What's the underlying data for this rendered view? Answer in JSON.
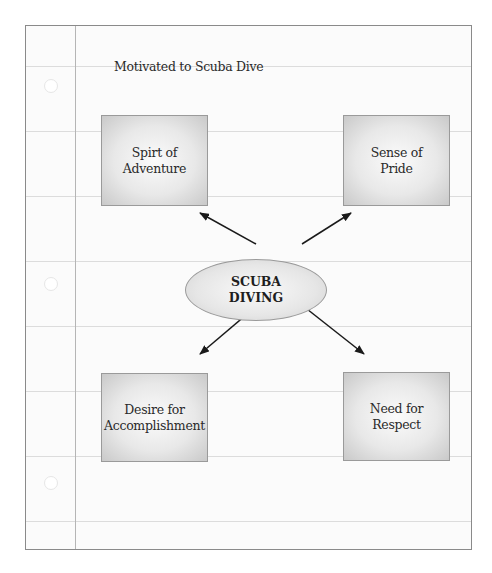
{
  "diagram": {
    "title": "Motivated to Scuba Dive",
    "center_node": {
      "label": "SCUBA\nDIVING"
    },
    "nodes": [
      {
        "position": "top-left",
        "label": "Spirt of\nAdventure"
      },
      {
        "position": "top-right",
        "label": "Sense of\nPride"
      },
      {
        "position": "bottom-left",
        "label": "Desire for\nAccomplishment"
      },
      {
        "position": "bottom-right",
        "label": "Need for\nRespect"
      }
    ],
    "edges": [
      {
        "from": "SCUBA DIVING",
        "to": "Spirt of Adventure",
        "arrow": "to"
      },
      {
        "from": "SCUBA DIVING",
        "to": "Sense of Pride",
        "arrow": "to"
      },
      {
        "from": "SCUBA DIVING",
        "to": "Desire for Accomplishment",
        "arrow": "to"
      },
      {
        "from": "SCUBA DIVING",
        "to": "Need for Respect",
        "arrow": "to"
      }
    ],
    "colors": {
      "box_fill": "#e8e8e8",
      "box_border": "#9a9a9a",
      "arrow": "#1a1a1a",
      "ruled_line": "#dcdcdc",
      "margin_line": "#b5b5b5"
    }
  }
}
